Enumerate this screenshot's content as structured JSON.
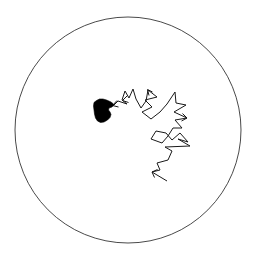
{
  "figure": {
    "type": "diagram",
    "canvas": {
      "width": 256,
      "height": 263,
      "background": "#ffffff"
    },
    "colors": {
      "boundary_stroke": "#4a4a4a",
      "path_stroke": "#1a1a1a",
      "target_fill": "#000000",
      "background": "#ffffff"
    }
  },
  "boundary": {
    "name": "circular-domain-boundary",
    "shape": "circle",
    "cx": 128,
    "cy": 130,
    "r": 113,
    "stroke_width": 1,
    "fill": "none"
  },
  "target_region": {
    "name": "absorbing-target-blob",
    "fill": "#000000",
    "polygon": "96.5,100.5 99.5,99.0 103.0,99.0 106.5,100.0 110.0,101.5 112.5,103.0 113.5,105.0 112.0,107.0 109.0,108.0 108.5,110.0 110.0,112.0 111.0,114.5 110.0,117.5 107.5,120.0 104.0,122.0 100.5,122.5 97.5,121.0 95.5,118.0 94.5,114.0 94.0,110.0 93.5,106.0 94.0,102.5"
  },
  "walk": {
    "name": "random-walk-trajectory",
    "step_count": 44,
    "start_point": [
      167,
      181
    ],
    "end_point": [
      112,
      106
    ],
    "stroke_width": 1,
    "points": [
      [
        167,
        181
      ],
      [
        152,
        172
      ],
      [
        160,
        170
      ],
      [
        157,
        163
      ],
      [
        168,
        160
      ],
      [
        172,
        151
      ],
      [
        165,
        147
      ],
      [
        190,
        146
      ],
      [
        178,
        139
      ],
      [
        188,
        142
      ],
      [
        180,
        133
      ],
      [
        172,
        140
      ],
      [
        166,
        133
      ],
      [
        156,
        131
      ],
      [
        151,
        139
      ],
      [
        162,
        143
      ],
      [
        168,
        136
      ],
      [
        173,
        128
      ],
      [
        182,
        128
      ],
      [
        175,
        120
      ],
      [
        187,
        118
      ],
      [
        174,
        112
      ],
      [
        186,
        105
      ],
      [
        176,
        103
      ],
      [
        175,
        92
      ],
      [
        167,
        104
      ],
      [
        160,
        112
      ],
      [
        151,
        119
      ],
      [
        142,
        112
      ],
      [
        152,
        107
      ],
      [
        145,
        100
      ],
      [
        157,
        97
      ],
      [
        148,
        90
      ],
      [
        146,
        101
      ],
      [
        141,
        108
      ],
      [
        136,
        99
      ],
      [
        133,
        89
      ],
      [
        129,
        98
      ],
      [
        125,
        91
      ],
      [
        122,
        100
      ],
      [
        127,
        104
      ],
      [
        118,
        101
      ],
      [
        114,
        105
      ],
      [
        112,
        106
      ]
    ]
  },
  "arrowheads": [
    {
      "name": "arrowhead-at-target",
      "points": "117,100.5 112.5,105.5 118.5,107.0",
      "direction": "toward-upper-left"
    },
    {
      "name": "arrowhead-mid-upper-left",
      "points": "127.5,95.5 122.5,100.5 128.5,102.5",
      "direction": "toward-upper-left"
    },
    {
      "name": "arrowhead-upper-right",
      "points": "152.5,92.0 147.5,89.5 149.0,95.5",
      "direction": "toward-upper-left"
    },
    {
      "name": "arrowhead-right-mid",
      "points": "182.5,113.5 187.0,118.0 181.5,121.0",
      "direction": "toward-right"
    },
    {
      "name": "arrowhead-lower-left-terminal",
      "points": "157.5,169.5 152.0,172.0 154.5,177.5",
      "direction": "toward-lower-left"
    }
  ],
  "labels": {
    "title": "",
    "caption": "",
    "axis_labels": [],
    "legend": []
  },
  "chart_data": {
    "type": "scatter",
    "title": "",
    "xlabel": "",
    "ylabel": "",
    "grid": false,
    "legend_position": "none",
    "series": [
      {
        "name": "random-walk-trajectory",
        "x": [
          167,
          152,
          160,
          157,
          168,
          172,
          165,
          190,
          178,
          188,
          180,
          172,
          166,
          156,
          151,
          162,
          168,
          173,
          182,
          175,
          187,
          174,
          186,
          176,
          175,
          167,
          160,
          151,
          142,
          152,
          145,
          157,
          148,
          146,
          141,
          136,
          133,
          129,
          125,
          122,
          127,
          118,
          114,
          112
        ],
        "y": [
          181,
          172,
          170,
          163,
          160,
          151,
          147,
          146,
          139,
          142,
          133,
          140,
          133,
          131,
          139,
          143,
          136,
          128,
          128,
          120,
          118,
          112,
          105,
          103,
          92,
          104,
          112,
          119,
          112,
          107,
          100,
          97,
          90,
          101,
          108,
          99,
          89,
          98,
          91,
          100,
          104,
          101,
          105,
          106
        ]
      }
    ],
    "annotations": [
      {
        "name": "circular-domain-boundary",
        "shape": "circle",
        "cx": 128,
        "cy": 130,
        "r": 113
      },
      {
        "name": "absorbing-target-blob",
        "shape": "polygon",
        "centroid": [
          103,
          110
        ]
      }
    ]
  }
}
